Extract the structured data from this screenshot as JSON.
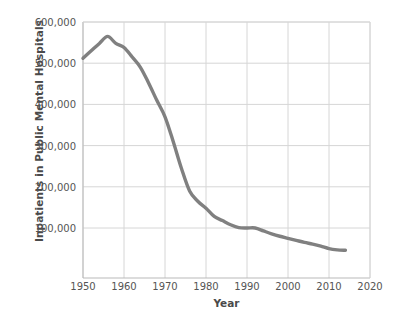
{
  "chart_data": {
    "type": "line",
    "title": "",
    "xlabel": "Year",
    "ylabel": "Inpatients in Public Mental Hospitals",
    "xlim": [
      1950,
      2020
    ],
    "ylim": [
      20000,
      600000
    ],
    "grid": true,
    "legend": "none",
    "line_color": "#808080",
    "grid_color": "#d6d6d6",
    "axis_color": "#cccccc",
    "background": "#ffffff",
    "xticks": [
      "1950",
      "1960",
      "1970",
      "1980",
      "1990",
      "2000",
      "2010",
      "2020"
    ],
    "xtick_values": [
      1950,
      1960,
      1970,
      1980,
      1990,
      2000,
      2010,
      2020
    ],
    "yticks": [
      "100,000",
      "200,000",
      "300,000",
      "400,000",
      "500,000",
      "600,000"
    ],
    "ytick_values": [
      100000,
      200000,
      300000,
      400000,
      500000,
      600000
    ],
    "series": [
      {
        "name": "Inpatients in Public Mental Hospitals",
        "x": [
          1950,
          1952,
          1954,
          1956,
          1958,
          1960,
          1962,
          1964,
          1966,
          1968,
          1970,
          1972,
          1974,
          1976,
          1978,
          1980,
          1982,
          1984,
          1986,
          1988,
          1990,
          1992,
          1994,
          1996,
          1998,
          2000,
          2002,
          2004,
          2006,
          2008,
          2010,
          2012,
          2014
        ],
        "values": [
          512000,
          530000,
          548000,
          565000,
          548000,
          538000,
          515000,
          490000,
          452000,
          410000,
          370000,
          310000,
          245000,
          190000,
          165000,
          148000,
          128000,
          118000,
          108000,
          101000,
          100000,
          100000,
          93000,
          86000,
          80000,
          75000,
          70000,
          65000,
          61000,
          56000,
          50000,
          47000,
          46000
        ]
      }
    ],
    "annotations": {
      "peak_year": 1956,
      "peak_value": 565000,
      "start_year": 1950,
      "start_value": 512000,
      "end_year": 2014,
      "end_value": 46000
    }
  }
}
